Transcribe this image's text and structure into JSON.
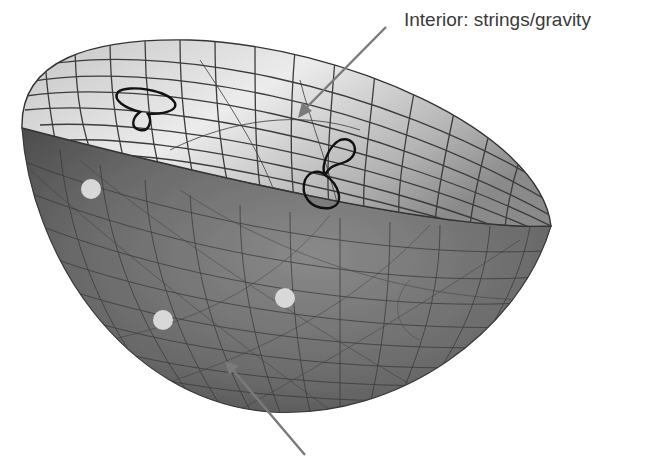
{
  "diagram": {
    "labels": {
      "interior": "Interior: strings/gravity"
    },
    "elements": {
      "hemisphere": "bulk-hemisphere",
      "interior_loops": [
        "closed-string-loop-left",
        "closed-string-loop-right"
      ],
      "boundary_dots": 3,
      "arrows": [
        "arrow-to-interior",
        "arrow-to-boundary"
      ]
    },
    "colors": {
      "outer_surface": "#6e6e6e",
      "outer_surface_dark": "#4a4a4a",
      "inner_surface_light": "#e6e6e6",
      "inner_surface_mid": "#a8a8a8",
      "grid_lines": "#3c3c3c",
      "string_loops": "#111111",
      "dots": "#d9d9d9",
      "arrows": "#7a7a7a",
      "label_text": "#3a3a3a"
    }
  }
}
